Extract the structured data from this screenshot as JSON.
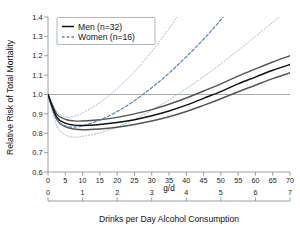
{
  "figure": {
    "background": "#ffffff",
    "men_color": "#111111",
    "men_ci_color": "#555555",
    "women_color": "#5b86c4",
    "women_ci_color": "#9ab4d8",
    "axis_color": "#8d949c",
    "refline_color": "#8d949c",
    "refline_value": 1.0
  },
  "legend": {
    "position": "top-left",
    "entries": [
      {
        "label": "Men (n=32)",
        "style": "solid",
        "color": "#111111"
      },
      {
        "label": "Women (n=16)",
        "style": "dashed",
        "color": "#5b86c4"
      }
    ]
  },
  "axes": {
    "y_title": "Relative Risk of Total Mortality",
    "y_ticks": [
      "0.6",
      "0.7",
      "0.8",
      "0.9",
      "1.0",
      "1.1",
      "1.2",
      "1.3",
      "1.4"
    ],
    "y_min": 0.6,
    "y_max": 1.4,
    "x_top_title": "g/d",
    "x_top_ticks": [
      "0",
      "5",
      "10",
      "15",
      "20",
      "25",
      "30",
      "35",
      "40",
      "45",
      "50",
      "55",
      "60",
      "65",
      "70"
    ],
    "x_top_min": 0,
    "x_top_max": 70,
    "x_bottom_title": "Drinks per Day Alcohol Consumption",
    "x_bottom_ticks": [
      "0",
      "1",
      "2",
      "3",
      "4",
      "5",
      "6",
      "7"
    ],
    "x_bottom_min": 0,
    "x_bottom_max": 7
  },
  "chart_data": {
    "type": "line",
    "title": "",
    "xlabel": "Drinks per Day Alcohol Consumption",
    "ylabel": "Relative Risk of Total Mortality",
    "xlabel_secondary": "g/d",
    "xlim": [
      0,
      70
    ],
    "ylim": [
      0.6,
      1.4
    ],
    "grid": false,
    "legend_position": "top-left",
    "reference_line_y": 1.0,
    "x": [
      0,
      2.5,
      5,
      7.5,
      10,
      15,
      20,
      25,
      30,
      35,
      40,
      45,
      50,
      55,
      60,
      65,
      70
    ],
    "series": [
      {
        "name": "Men (n=32)",
        "style": "solid",
        "color": "#111111",
        "values": [
          1.0,
          0.885,
          0.852,
          0.842,
          0.84,
          0.845,
          0.855,
          0.87,
          0.89,
          0.915,
          0.945,
          0.98,
          1.015,
          1.055,
          1.09,
          1.125,
          1.155
        ]
      },
      {
        "name": "Men upper 95% CI",
        "style": "solid",
        "color": "#555555",
        "values": [
          1.0,
          0.9,
          0.872,
          0.864,
          0.863,
          0.87,
          0.882,
          0.9,
          0.922,
          0.95,
          0.982,
          1.018,
          1.055,
          1.095,
          1.132,
          1.168,
          1.2
        ]
      },
      {
        "name": "Men lower 95% CI",
        "style": "solid",
        "color": "#555555",
        "values": [
          1.0,
          0.872,
          0.834,
          0.822,
          0.818,
          0.822,
          0.831,
          0.845,
          0.863,
          0.885,
          0.912,
          0.944,
          0.978,
          1.014,
          1.048,
          1.082,
          1.112
        ]
      },
      {
        "name": "Women (n=16)",
        "style": "dashed",
        "color": "#5b86c4",
        "values": [
          1.0,
          0.875,
          0.838,
          0.832,
          0.838,
          0.868,
          0.912,
          0.968,
          1.035,
          1.11,
          1.195,
          1.285,
          1.385,
          1.49,
          1.6,
          1.71,
          1.82
        ]
      },
      {
        "name": "Women upper 95% CI",
        "style": "dotted",
        "color": "#9ab4d8",
        "values": [
          1.0,
          0.912,
          0.885,
          0.888,
          0.905,
          0.958,
          1.03,
          1.118,
          1.222,
          1.34,
          1.47,
          1.61,
          1.76,
          1.92,
          2.08,
          2.25,
          2.42
        ]
      },
      {
        "name": "Women lower 95% CI",
        "style": "dotted",
        "color": "#9ab4d8",
        "values": [
          1.0,
          0.84,
          0.792,
          0.78,
          0.784,
          0.802,
          0.832,
          0.872,
          0.918,
          0.972,
          1.03,
          1.092,
          1.158,
          1.228,
          1.3,
          1.372,
          1.448
        ]
      }
    ]
  }
}
